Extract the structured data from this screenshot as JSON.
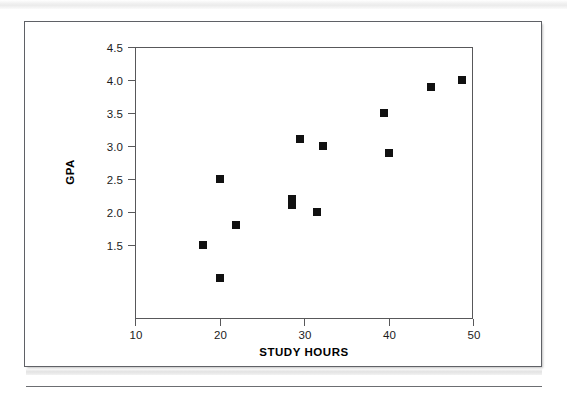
{
  "chart_data": {
    "type": "scatter",
    "title": "",
    "xlabel": "STUDY HOURS",
    "ylabel": "GPA",
    "xlim": [
      10,
      50
    ],
    "ylim": [
      0.38,
      4.5
    ],
    "xticks": [
      "10",
      "20",
      "30",
      "40",
      "50"
    ],
    "xtick_values": [
      10,
      20,
      30,
      40,
      50
    ],
    "yticks": [
      "1.5",
      "2.0",
      "2.5",
      "3.0",
      "3.5",
      "4.0",
      "4.5"
    ],
    "ytick_values": [
      1.5,
      2.0,
      2.5,
      3.0,
      3.5,
      4.0,
      4.5
    ],
    "grid": false,
    "legend": false,
    "marker": "filled-square",
    "marker_color": "#111111",
    "series": [
      {
        "name": "students",
        "points": [
          {
            "x": 18.0,
            "y": 1.5
          },
          {
            "x": 20.0,
            "y": 2.5
          },
          {
            "x": 20.0,
            "y": 1.0
          },
          {
            "x": 22.0,
            "y": 1.8
          },
          {
            "x": 28.6,
            "y": 2.2
          },
          {
            "x": 28.6,
            "y": 2.1
          },
          {
            "x": 29.5,
            "y": 3.1
          },
          {
            "x": 31.5,
            "y": 2.0
          },
          {
            "x": 32.3,
            "y": 3.0
          },
          {
            "x": 39.5,
            "y": 3.5
          },
          {
            "x": 40.0,
            "y": 2.9
          },
          {
            "x": 45.0,
            "y": 3.9
          },
          {
            "x": 48.7,
            "y": 4.0
          }
        ]
      }
    ]
  },
  "figure": {
    "border_color": "#5f6166",
    "axis_color": "#58585a",
    "background": "#ffffff"
  }
}
